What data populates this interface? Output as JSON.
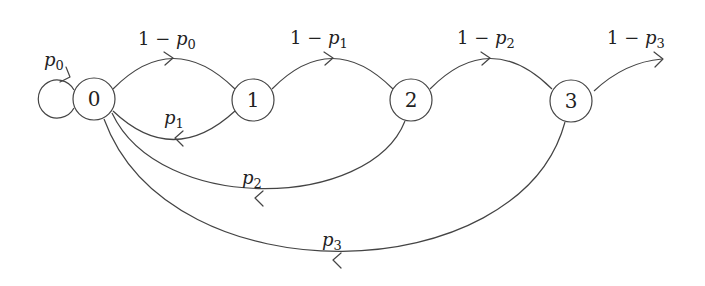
{
  "diagram": {
    "type": "state-transition-diagram",
    "nodes": [
      {
        "id": "0",
        "label": "0"
      },
      {
        "id": "1",
        "label": "1"
      },
      {
        "id": "2",
        "label": "2"
      },
      {
        "id": "3",
        "label": "3"
      }
    ],
    "edges": [
      {
        "from": "0",
        "to": "0",
        "label_prefix": "",
        "label_var": "p",
        "label_sub": "0"
      },
      {
        "from": "0",
        "to": "1",
        "label_prefix": "1 − ",
        "label_var": "p",
        "label_sub": "0"
      },
      {
        "from": "1",
        "to": "0",
        "label_prefix": "",
        "label_var": "p",
        "label_sub": "1"
      },
      {
        "from": "1",
        "to": "2",
        "label_prefix": "1 − ",
        "label_var": "p",
        "label_sub": "1"
      },
      {
        "from": "2",
        "to": "0",
        "label_prefix": "",
        "label_var": "p",
        "label_sub": "2"
      },
      {
        "from": "2",
        "to": "3",
        "label_prefix": "1 − ",
        "label_var": "p",
        "label_sub": "2"
      },
      {
        "from": "3",
        "to": "0",
        "label_prefix": "",
        "label_var": "p",
        "label_sub": "3"
      },
      {
        "from": "3",
        "to": "exit",
        "label_prefix": "1 − ",
        "label_var": "p",
        "label_sub": "3"
      }
    ],
    "colors": {
      "stroke": "#444444",
      "text": "#222222",
      "background": "#ffffff"
    }
  }
}
